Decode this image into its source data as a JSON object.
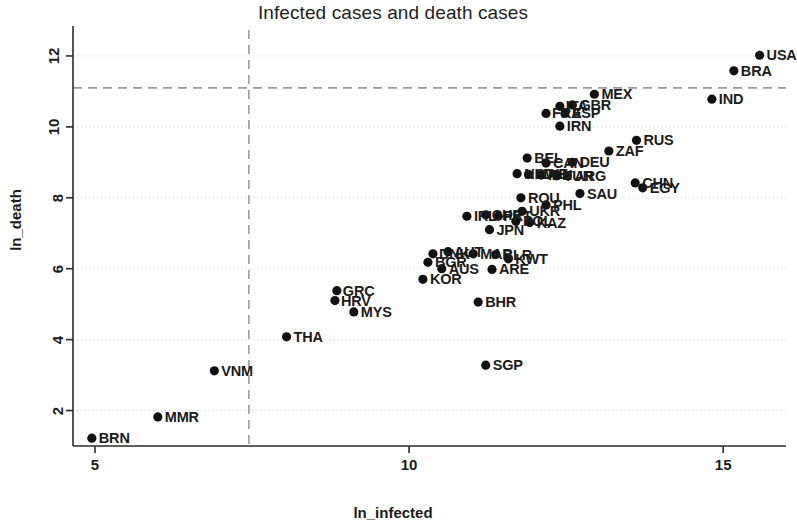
{
  "chart_data": {
    "type": "scatter",
    "title": "Infected cases and death cases",
    "xlabel": "ln_infected",
    "ylabel": "ln_death",
    "xlim": [
      4.65,
      16.0
    ],
    "ylim": [
      1.0,
      12.45
    ],
    "xticks": [
      5,
      10,
      15
    ],
    "xtick_labels": [
      "5",
      "10",
      "15"
    ],
    "yticks": [
      2,
      4,
      6,
      8,
      10,
      12
    ],
    "ytick_labels": [
      "2",
      "4",
      "6",
      "8",
      "10",
      "12"
    ],
    "grid": true,
    "grid_style": "dotted-light",
    "legend": "none",
    "marker": "filled-circle",
    "marker_color": "#111111",
    "reference_lines": [
      {
        "name": "mean-ln_death",
        "orientation": "horizontal",
        "value": 11.1,
        "style": "dashed",
        "color": "#9a9a9a"
      },
      {
        "name": "mean-ln_infected",
        "orientation": "vertical",
        "value": 7.45,
        "style": "dashed",
        "color": "#9a9a9a"
      }
    ],
    "points": [
      {
        "label": "USA",
        "x": 15.58,
        "y": 12.02,
        "lx": 7,
        "ly": 0
      },
      {
        "label": "BRA",
        "x": 15.17,
        "y": 11.58,
        "lx": 7,
        "ly": 0
      },
      {
        "label": "IND",
        "x": 14.82,
        "y": 10.78,
        "lx": 7,
        "ly": 0
      },
      {
        "label": "MEX",
        "x": 12.95,
        "y": 10.92,
        "lx": 7,
        "ly": 0
      },
      {
        "label": "GBR",
        "x": 12.6,
        "y": 10.62,
        "lx": 7,
        "ly": 0
      },
      {
        "label": "ITA",
        "x": 12.4,
        "y": 10.58,
        "lx": 6,
        "ly": 0
      },
      {
        "label": "FRA",
        "x": 12.18,
        "y": 10.38,
        "lx": 6,
        "ly": 0
      },
      {
        "label": "ESP",
        "x": 12.48,
        "y": 10.38,
        "lx": 7,
        "ly": 0
      },
      {
        "label": "IRN",
        "x": 12.4,
        "y": 10.02,
        "lx": 7,
        "ly": 0
      },
      {
        "label": "RUS",
        "x": 13.62,
        "y": 9.62,
        "lx": 7,
        "ly": 0
      },
      {
        "label": "ZAF",
        "x": 13.18,
        "y": 9.32,
        "lx": 7,
        "ly": 0
      },
      {
        "label": "BEL",
        "x": 11.88,
        "y": 9.12,
        "lx": 7,
        "ly": 0
      },
      {
        "label": "CAN",
        "x": 12.18,
        "y": 8.98,
        "lx": 7,
        "ly": 0
      },
      {
        "label": "DEU",
        "x": 12.6,
        "y": 9.0,
        "lx": 7,
        "ly": 0
      },
      {
        "label": "NLD",
        "x": 11.72,
        "y": 8.68,
        "lx": 7,
        "ly": 0
      },
      {
        "label": "SWE",
        "x": 11.9,
        "y": 8.66,
        "lx": 7,
        "ly": 0
      },
      {
        "label": "IDN",
        "x": 12.1,
        "y": 8.64,
        "lx": 7,
        "ly": 0
      },
      {
        "label": "TUR",
        "x": 12.35,
        "y": 8.62,
        "lx": 7,
        "ly": 0
      },
      {
        "label": "ARG",
        "x": 12.52,
        "y": 8.62,
        "lx": 7,
        "ly": 0
      },
      {
        "label": "CHN",
        "x": 13.6,
        "y": 8.42,
        "lx": 7,
        "ly": 0
      },
      {
        "label": "EGY",
        "x": 13.72,
        "y": 8.28,
        "lx": 7,
        "ly": 0
      },
      {
        "label": "SAU",
        "x": 12.72,
        "y": 8.12,
        "lx": 7,
        "ly": 0
      },
      {
        "label": "ROU",
        "x": 11.78,
        "y": 8.0,
        "lx": 7,
        "ly": 0
      },
      {
        "label": "PHL",
        "x": 12.18,
        "y": 7.8,
        "lx": 7,
        "ly": 0
      },
      {
        "label": "UKR",
        "x": 11.8,
        "y": 7.62,
        "lx": 7,
        "ly": 0
      },
      {
        "label": "IRL",
        "x": 10.92,
        "y": 7.48,
        "lx": 7,
        "ly": 0
      },
      {
        "label": "CHE",
        "x": 11.22,
        "y": 7.52,
        "lx": 6,
        "ly": 0
      },
      {
        "label": "PRT",
        "x": 11.42,
        "y": 7.48,
        "lx": 5,
        "ly": 0
      },
      {
        "label": "POL",
        "x": 11.7,
        "y": 7.34,
        "lx": 7,
        "ly": 0
      },
      {
        "label": "KAZ",
        "x": 11.92,
        "y": 7.3,
        "lx": 7,
        "ly": 0
      },
      {
        "label": "JPN",
        "x": 11.28,
        "y": 7.1,
        "lx": 7,
        "ly": 0
      },
      {
        "label": "AUT",
        "x": 10.62,
        "y": 6.48,
        "lx": 6,
        "ly": 0
      },
      {
        "label": "DNK",
        "x": 10.38,
        "y": 6.42,
        "lx": 6,
        "ly": 0
      },
      {
        "label": "MAR",
        "x": 11.02,
        "y": 6.42,
        "lx": 7,
        "ly": 0
      },
      {
        "label": "BLR",
        "x": 11.38,
        "y": 6.4,
        "lx": 7,
        "ly": 0
      },
      {
        "label": "KWT",
        "x": 11.58,
        "y": 6.28,
        "lx": 7,
        "ly": 0
      },
      {
        "label": "BGR",
        "x": 10.3,
        "y": 6.18,
        "lx": 7,
        "ly": 0
      },
      {
        "label": "AUS",
        "x": 10.52,
        "y": 6.0,
        "lx": 7,
        "ly": 0
      },
      {
        "label": "ARE",
        "x": 11.32,
        "y": 5.98,
        "lx": 7,
        "ly": 0
      },
      {
        "label": "KOR",
        "x": 10.22,
        "y": 5.7,
        "lx": 7,
        "ly": 0
      },
      {
        "label": "GRC",
        "x": 8.85,
        "y": 5.38,
        "lx": 6,
        "ly": 0
      },
      {
        "label": "HRV",
        "x": 8.82,
        "y": 5.1,
        "lx": 6,
        "ly": 0
      },
      {
        "label": "BHR",
        "x": 11.1,
        "y": 5.06,
        "lx": 7,
        "ly": 0
      },
      {
        "label": "MYS",
        "x": 9.12,
        "y": 4.78,
        "lx": 7,
        "ly": 0
      },
      {
        "label": "THA",
        "x": 8.05,
        "y": 4.08,
        "lx": 7,
        "ly": 0
      },
      {
        "label": "VNM",
        "x": 6.9,
        "y": 3.12,
        "lx": 7,
        "ly": 0
      },
      {
        "label": "SGP",
        "x": 11.22,
        "y": 3.28,
        "lx": 7,
        "ly": 0
      },
      {
        "label": "MMR",
        "x": 6.0,
        "y": 1.82,
        "lx": 7,
        "ly": 0
      },
      {
        "label": "BRN",
        "x": 4.95,
        "y": 1.22,
        "lx": 7,
        "ly": 0
      }
    ]
  },
  "axes": {
    "x_title": "ln_infected",
    "y_title": "ln_death"
  }
}
